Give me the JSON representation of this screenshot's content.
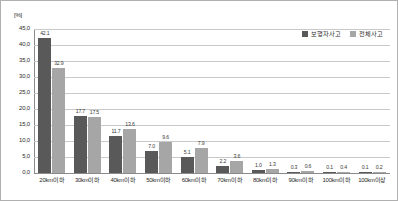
{
  "chart_data": {
    "type": "bar",
    "title": "",
    "xlabel": "",
    "ylabel": "[%]",
    "ylim": [
      0.0,
      45.0
    ],
    "ytick_step": 5.0,
    "ytick_labels": [
      "45,0",
      "40,0",
      "35,0",
      "30,0",
      "25,0",
      "20,0",
      "15,0",
      "10,0",
      "5,0",
      "0,0"
    ],
    "grid": true,
    "legend_position": "top-right",
    "categories": [
      "20km이하",
      "30km이하",
      "40km이하",
      "50km이하",
      "60km이하",
      "70km이하",
      "80km이하",
      "90km이하",
      "100km이하",
      "100km이상"
    ],
    "series": [
      {
        "name": "보행자사고",
        "color": "#595959",
        "values": [
          42.1,
          17.7,
          11.7,
          7.0,
          5.1,
          2.2,
          1.0,
          0.3,
          0.1,
          0.1
        ],
        "value_labels": [
          "42.1",
          "17.7",
          "11.7",
          "7.0",
          "5.1",
          "2.2",
          "1.0",
          "0.3",
          "0.1",
          "0.1"
        ]
      },
      {
        "name": "전체사고",
        "color": "#a6a6a6",
        "values": [
          32.9,
          17.5,
          13.6,
          9.6,
          7.9,
          3.6,
          1.3,
          0.6,
          0.4,
          0.2
        ],
        "value_labels": [
          "32.9",
          "17.5",
          "13.6",
          "9.6",
          "7.9",
          "3.6",
          "1.3",
          "0.6",
          "0.4",
          "0.2"
        ]
      }
    ]
  }
}
